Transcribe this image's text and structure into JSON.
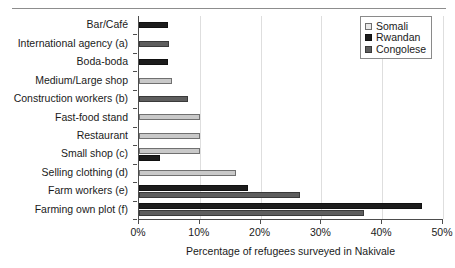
{
  "chart_data": {
    "type": "bar",
    "orientation": "horizontal",
    "title": "",
    "xlabel": "Percentage of refugees surveyed in  Nakivale",
    "ylabel": "",
    "xlim": [
      0,
      50
    ],
    "xtick_labels": [
      "0%",
      "10%",
      "20%",
      "30%",
      "40%",
      "50%"
    ],
    "xtick_values": [
      0,
      10,
      20,
      30,
      40,
      50
    ],
    "grid": true,
    "grid_axis": "x",
    "legend_position": "top-right",
    "categories": [
      "Bar/Café",
      "International agency (a)",
      "Boda-boda",
      "Medium/Large shop",
      "Construction workers (b)",
      "Fast-food stand",
      "Restaurant",
      "Small shop (c)",
      "Selling clothing (d)",
      "Farm workers (e)",
      "Farming own plot (f)"
    ],
    "series": [
      {
        "name": "Somali",
        "color": "#c9c9c9",
        "values": [
          0,
          0,
          0,
          5.5,
          0,
          10.0,
          10.0,
          10.0,
          16.0,
          0,
          0
        ]
      },
      {
        "name": "Rwandan",
        "color": "#1c1c1c",
        "values": [
          4.8,
          0,
          4.8,
          0,
          0,
          0,
          0,
          3.5,
          0,
          18.0,
          46.5
        ]
      },
      {
        "name": "Congolese",
        "color": "#5e5e5e",
        "values": [
          0,
          4.9,
          0,
          0,
          8.0,
          0,
          0,
          0,
          0,
          26.5,
          37.0
        ]
      }
    ]
  },
  "legend": {
    "items": [
      {
        "label": "Somali",
        "key": "somali"
      },
      {
        "label": "Rwandan",
        "key": "rwandan"
      },
      {
        "label": "Congolese",
        "key": "congolese"
      }
    ]
  }
}
